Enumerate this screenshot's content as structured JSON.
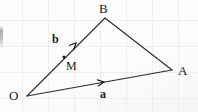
{
  "figure": {
    "width": 198,
    "height": 112,
    "background_color": "#fdfdfd",
    "ink_color": "#1b1b1b"
  },
  "vertices": [
    {
      "id": "O",
      "label": "O",
      "x": 27,
      "y": 96,
      "label_x": 9,
      "label_y": 89
    },
    {
      "id": "A",
      "label": "A",
      "x": 172,
      "y": 70,
      "label_x": 178,
      "label_y": 64
    },
    {
      "id": "B",
      "label": "B",
      "x": 105,
      "y": 18,
      "label_x": 99,
      "label_y": 2
    }
  ],
  "points": [
    {
      "id": "M",
      "label": "M",
      "x": 64,
      "y": 57,
      "label_x": 66,
      "label_y": 60,
      "dot": true
    }
  ],
  "edges": [
    {
      "id": "OB",
      "from": "O",
      "to": "B",
      "x1": 27,
      "y1": 96,
      "x2": 105,
      "y2": 18
    },
    {
      "id": "BA",
      "from": "B",
      "to": "A",
      "x1": 105,
      "y1": 18,
      "x2": 172,
      "y2": 70
    },
    {
      "id": "OA",
      "from": "O",
      "to": "A",
      "x1": 27,
      "y1": 96,
      "x2": 172,
      "y2": 70
    }
  ],
  "vectors": [
    {
      "id": "b",
      "label": "b",
      "along_edge": "OB",
      "arrow_tip_x": 76,
      "arrow_tip_y": 43,
      "arrow_tail_x": 62,
      "arrow_tail_y": 57,
      "label_x": 52,
      "label_y": 33
    },
    {
      "id": "a",
      "label": "a",
      "along_edge": "OA",
      "arrow_tip_x": 104,
      "arrow_tip_y": 82,
      "arrow_tail_x": 90,
      "arrow_tail_y": 84,
      "label_x": 100,
      "label_y": 88
    }
  ]
}
